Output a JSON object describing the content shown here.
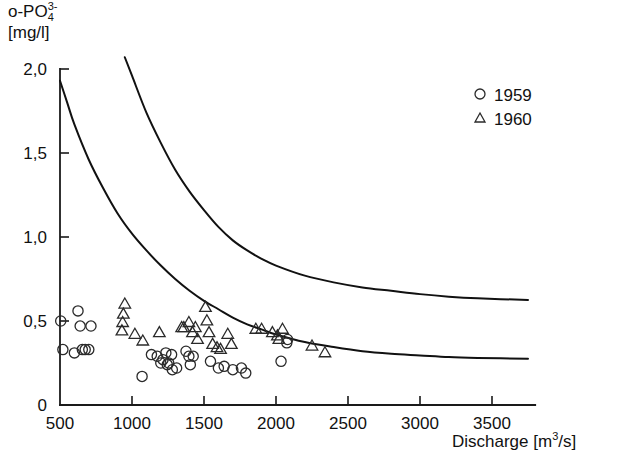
{
  "figure": {
    "ylabel_main": "o-PO",
    "ylabel_sub": "4",
    "ylabel_sup": "3-",
    "ylabel_units": "[mg/l]",
    "xlabel_text": "Discharge [m",
    "xlabel_sup": "3",
    "xlabel_tail": "/s]"
  },
  "legend": {
    "items": [
      {
        "marker": "circle-marker",
        "label": "1959"
      },
      {
        "marker": "triangle-marker",
        "label": "1960"
      }
    ]
  },
  "chart_data": {
    "type": "scatter",
    "title": "",
    "xlabel": "Discharge [m3/s]",
    "ylabel": "o-PO4 3- [mg/l]",
    "xlim": [
      500,
      3800
    ],
    "ylim": [
      0,
      2.0
    ],
    "xticks": [
      500,
      1000,
      1500,
      2000,
      2500,
      3000,
      3500
    ],
    "xtick_labels": [
      "500",
      "1000",
      "1500",
      "2000",
      "2500",
      "3000",
      "3500"
    ],
    "yticks": [
      0,
      0.5,
      1.0,
      1.5,
      2.0
    ],
    "ytick_labels": [
      "0",
      "0,5",
      "1,0",
      "1,5",
      "2,0"
    ],
    "grid": false,
    "legend_position": "top-right",
    "series": [
      {
        "name": "1959",
        "marker": "circle",
        "points": [
          [
            505,
            0.5
          ],
          [
            520,
            0.33
          ],
          [
            600,
            0.31
          ],
          [
            625,
            0.56
          ],
          [
            640,
            0.47
          ],
          [
            655,
            0.33
          ],
          [
            675,
            0.33
          ],
          [
            700,
            0.33
          ],
          [
            715,
            0.47
          ],
          [
            1070,
            0.17
          ],
          [
            1135,
            0.3
          ],
          [
            1175,
            0.29
          ],
          [
            1200,
            0.25
          ],
          [
            1215,
            0.27
          ],
          [
            1235,
            0.31
          ],
          [
            1245,
            0.24
          ],
          [
            1255,
            0.25
          ],
          [
            1275,
            0.3
          ],
          [
            1280,
            0.21
          ],
          [
            1310,
            0.22
          ],
          [
            1375,
            0.32
          ],
          [
            1395,
            0.29
          ],
          [
            1405,
            0.24
          ],
          [
            1425,
            0.29
          ],
          [
            1545,
            0.26
          ],
          [
            1600,
            0.22
          ],
          [
            1640,
            0.23
          ],
          [
            1700,
            0.21
          ],
          [
            1760,
            0.22
          ],
          [
            1790,
            0.19
          ],
          [
            2035,
            0.26
          ],
          [
            2075,
            0.37
          ],
          [
            2080,
            0.39
          ]
        ]
      },
      {
        "name": "1960",
        "marker": "triangle",
        "points": [
          [
            930,
            0.44
          ],
          [
            935,
            0.49
          ],
          [
            940,
            0.54
          ],
          [
            950,
            0.6
          ],
          [
            1020,
            0.42
          ],
          [
            1075,
            0.38
          ],
          [
            1190,
            0.43
          ],
          [
            1345,
            0.46
          ],
          [
            1360,
            0.46
          ],
          [
            1395,
            0.49
          ],
          [
            1420,
            0.43
          ],
          [
            1440,
            0.46
          ],
          [
            1455,
            0.39
          ],
          [
            1510,
            0.58
          ],
          [
            1520,
            0.5
          ],
          [
            1535,
            0.43
          ],
          [
            1560,
            0.36
          ],
          [
            1590,
            0.34
          ],
          [
            1615,
            0.33
          ],
          [
            1665,
            0.42
          ],
          [
            1690,
            0.36
          ],
          [
            1860,
            0.45
          ],
          [
            1900,
            0.45
          ],
          [
            1975,
            0.43
          ],
          [
            2010,
            0.41
          ],
          [
            2020,
            0.39
          ],
          [
            2045,
            0.45
          ],
          [
            2250,
            0.35
          ],
          [
            2340,
            0.31
          ]
        ]
      }
    ],
    "curves": [
      {
        "name": "upper-regression-curve",
        "points": [
          [
            950,
            2.07
          ],
          [
            1000,
            1.96
          ],
          [
            1100,
            1.74
          ],
          [
            1200,
            1.56
          ],
          [
            1300,
            1.4
          ],
          [
            1400,
            1.27
          ],
          [
            1500,
            1.16
          ],
          [
            1600,
            1.06
          ],
          [
            1700,
            0.98
          ],
          [
            1800,
            0.92
          ],
          [
            1900,
            0.87
          ],
          [
            2000,
            0.83
          ],
          [
            2200,
            0.77
          ],
          [
            2400,
            0.73
          ],
          [
            2600,
            0.7
          ],
          [
            2800,
            0.68
          ],
          [
            3000,
            0.66
          ],
          [
            3200,
            0.645
          ],
          [
            3400,
            0.635
          ],
          [
            3750,
            0.625
          ]
        ]
      },
      {
        "name": "lower-regression-curve",
        "points": [
          [
            500,
            1.93
          ],
          [
            550,
            1.8
          ],
          [
            600,
            1.67
          ],
          [
            700,
            1.46
          ],
          [
            800,
            1.29
          ],
          [
            900,
            1.14
          ],
          [
            1000,
            1.02
          ],
          [
            1100,
            0.92
          ],
          [
            1200,
            0.83
          ],
          [
            1300,
            0.75
          ],
          [
            1400,
            0.68
          ],
          [
            1500,
            0.62
          ],
          [
            1600,
            0.57
          ],
          [
            1700,
            0.52
          ],
          [
            1800,
            0.48
          ],
          [
            1900,
            0.45
          ],
          [
            2000,
            0.42
          ],
          [
            2200,
            0.375
          ],
          [
            2400,
            0.345
          ],
          [
            2600,
            0.32
          ],
          [
            2800,
            0.305
          ],
          [
            3000,
            0.295
          ],
          [
            3200,
            0.285
          ],
          [
            3400,
            0.28
          ],
          [
            3750,
            0.275
          ]
        ]
      }
    ]
  }
}
